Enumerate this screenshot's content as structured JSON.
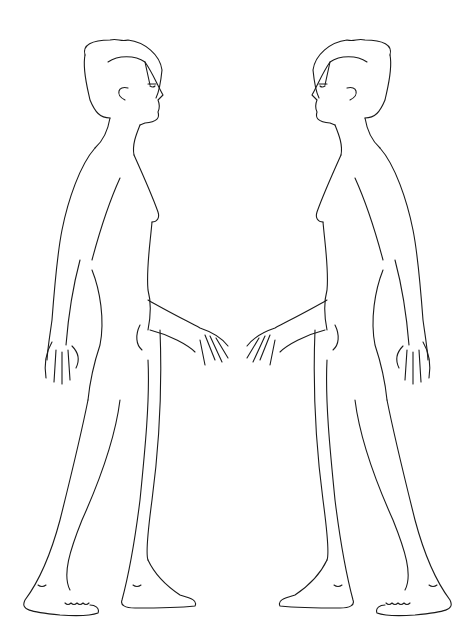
{
  "image": {
    "background": "#ffffff",
    "line_color": "#1a1a1a",
    "description": "Line drawing of two mirrored standing human figures in side profile facing each other",
    "figures": [
      {
        "id": "left-figure",
        "facing": "right"
      },
      {
        "id": "right-figure",
        "facing": "left"
      }
    ]
  }
}
